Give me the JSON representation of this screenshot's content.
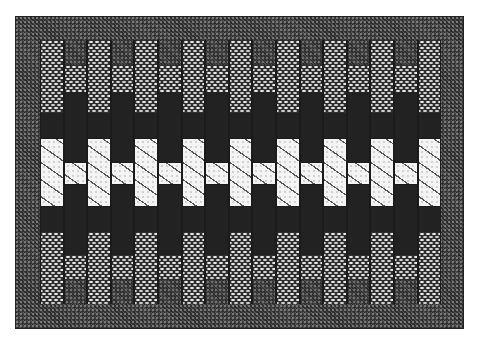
{
  "image": {
    "subject": "woven rug / textile pattern",
    "description": "Rectangular woven panel with a dark textured border and 17 alternating vertical strips forming a symmetric stepped band pattern, white band across the middle"
  },
  "colors": {
    "background": "#ffffff",
    "border": "#3b3b3b",
    "dark_band": "#3a3a3a",
    "mesh_band": "#2e2e2e",
    "diagonal_band": "#d8d8d8",
    "white_band": "#f4f4f4"
  },
  "pattern": {
    "column_count": 17,
    "column_sequence": [
      "A",
      "B",
      "A",
      "B",
      "A",
      "B",
      "A",
      "B",
      "A",
      "B",
      "A",
      "B",
      "A",
      "B",
      "A",
      "B",
      "A"
    ],
    "column_types": {
      "A": [
        "mesh",
        "diagonal",
        "white",
        "diagonal",
        "mesh"
      ],
      "B": [
        "dark",
        "mesh",
        "diagonal",
        "white",
        "diagonal",
        "mesh",
        "dark"
      ]
    }
  }
}
